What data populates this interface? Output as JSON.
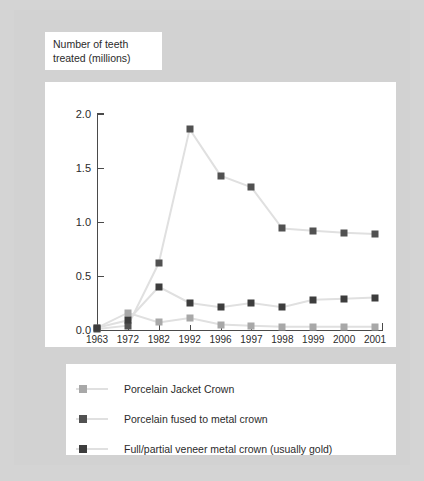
{
  "figure": {
    "background_color": "#d2d2d2",
    "panel_color": "#ffffff"
  },
  "axis_title": {
    "line1": "Number of teeth",
    "line2": "treated (millions)"
  },
  "chart_data": {
    "type": "line",
    "title": "",
    "subtitle": "",
    "xlabel": "",
    "ylabel": "Number of teeth treated (millions)",
    "categories": [
      "1963",
      "1972",
      "1982",
      "1992",
      "1996",
      "1997",
      "1998",
      "1999",
      "2000",
      "2001"
    ],
    "ylim": [
      0.0,
      2.0
    ],
    "ytick_labels": [
      "0.0",
      "0.5",
      "1.0",
      "1.5",
      "2.0"
    ],
    "ytick_values": [
      0.0,
      0.5,
      1.0,
      1.5,
      2.0
    ],
    "grid": false,
    "legend_position": "below",
    "series": [
      {
        "name": "Porcelain Jacket Crown",
        "color": "#a8a8a8",
        "marker": "square",
        "values": [
          0.02,
          0.16,
          0.07,
          0.11,
          0.05,
          0.04,
          0.03,
          0.03,
          0.03,
          0.03
        ]
      },
      {
        "name": "Porcelain fused to metal crown",
        "color": "#515151",
        "marker": "square",
        "values": [
          0.01,
          0.04,
          0.62,
          1.86,
          1.43,
          1.32,
          0.94,
          0.92,
          0.9,
          0.89
        ]
      },
      {
        "name": "Full/partial veneer metal crown (usually gold)",
        "color": "#3d3d3d",
        "marker": "square",
        "values": [
          0.02,
          0.09,
          0.4,
          0.25,
          0.21,
          0.25,
          0.21,
          0.28,
          0.29,
          0.3
        ]
      }
    ]
  },
  "legend": {
    "items": [
      {
        "label": "Porcelain Jacket Crown",
        "color": "#a8a8a8"
      },
      {
        "label": "Porcelain fused to metal crown",
        "color": "#515151"
      },
      {
        "label": "Full/partial veneer metal crown (usually gold)",
        "color": "#3d3d3d"
      }
    ]
  }
}
